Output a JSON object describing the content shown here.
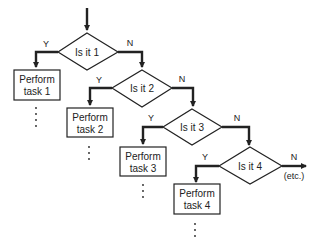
{
  "diagram": {
    "type": "flowchart",
    "decisions": [
      {
        "label": "Is it 1",
        "yes": "Y",
        "no": "N"
      },
      {
        "label": "Is it 2",
        "yes": "Y",
        "no": "N"
      },
      {
        "label": "Is it 3",
        "yes": "Y",
        "no": "N"
      },
      {
        "label": "Is it 4",
        "yes": "Y",
        "no": "N"
      }
    ],
    "tasks": [
      {
        "line1": "Perform",
        "line2": "task 1"
      },
      {
        "line1": "Perform",
        "line2": "task 2"
      },
      {
        "line1": "Perform",
        "line2": "task 3"
      },
      {
        "line1": "Perform",
        "line2": "task 4"
      }
    ],
    "continuation": "(etc.)"
  }
}
